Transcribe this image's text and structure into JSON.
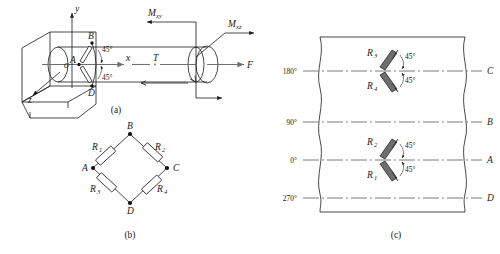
{
  "figure": {
    "captions": {
      "a": "(a)",
      "b": "(b)",
      "c": "(c)"
    }
  },
  "subfigure_a": {
    "name": "shaft-loading-diagram",
    "axes": {
      "y": "y",
      "z": "z",
      "x": "x",
      "origin": "o"
    },
    "loads": {
      "moment_xy": "M",
      "moment_xy_sub": "xy",
      "moment_xz": "M",
      "moment_xz_sub": "xz",
      "axial_force": "F",
      "torque": "T"
    },
    "gauge_points": {
      "b": "B",
      "a": "A",
      "d": "D"
    },
    "angles": [
      "45°",
      "45°"
    ]
  },
  "subfigure_b": {
    "name": "wheatstone-bridge",
    "nodes": {
      "top": "B",
      "left": "A",
      "right": "C",
      "bottom": "D"
    },
    "resistors": [
      {
        "id": "R",
        "sub": "1",
        "position": "upper-left"
      },
      {
        "id": "R",
        "sub": "2",
        "position": "upper-right"
      },
      {
        "id": "R",
        "sub": "3",
        "position": "lower-left"
      },
      {
        "id": "R",
        "sub": "4",
        "position": "lower-right"
      }
    ]
  },
  "subfigure_c": {
    "name": "unrolled-surface-gauge-layout",
    "angle_labels": [
      "180°",
      "90°",
      "0°",
      "270°"
    ],
    "node_labels": [
      "C",
      "B",
      "A",
      "D"
    ],
    "rosettes": [
      {
        "at_angle": "180°",
        "upper": {
          "id": "R",
          "sub": "3"
        },
        "lower": {
          "id": "R",
          "sub": "4"
        },
        "angles": [
          "45°",
          "45°"
        ]
      },
      {
        "at_angle": "0°",
        "upper": {
          "id": "R",
          "sub": "2"
        },
        "lower": {
          "id": "R",
          "sub": "1"
        },
        "angles": [
          "45°",
          "45°"
        ]
      }
    ]
  },
  "colors": {
    "stroke": "#1a1a1a",
    "axis_gray": "#6f6f6f",
    "gauge_fill": "#6e6e6e",
    "background": "#ffffff"
  }
}
